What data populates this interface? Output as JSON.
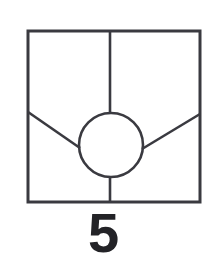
{
  "figure": {
    "label": "5",
    "label_color": "#232327",
    "background_color": "#ffffff",
    "stroke_color": "#3a3a40",
    "canvas": {
      "width": 207,
      "height": 268
    },
    "frame": {
      "name": "square-outline",
      "x": 28,
      "y": 31,
      "width": 172,
      "height": 171,
      "stroke_width": 3
    },
    "circle": {
      "name": "center-circle",
      "cx": 111,
      "cy": 145,
      "r": 32,
      "stroke_width": 2.6
    },
    "segments": [
      {
        "name": "vertical-line-top",
        "x1": 110,
        "y1": 31,
        "x2": 110,
        "y2": 113,
        "stroke_width": 2.6
      },
      {
        "name": "vertical-line-bottom",
        "x1": 110,
        "y1": 177,
        "x2": 110,
        "y2": 202,
        "stroke_width": 2.6
      },
      {
        "name": "diagonal-line-left",
        "x1": 28,
        "y1": 112,
        "x2": 80,
        "y2": 148,
        "stroke_width": 2.6
      },
      {
        "name": "diagonal-line-right",
        "x1": 200,
        "y1": 114,
        "x2": 142,
        "y2": 149,
        "stroke_width": 2.6
      }
    ]
  }
}
